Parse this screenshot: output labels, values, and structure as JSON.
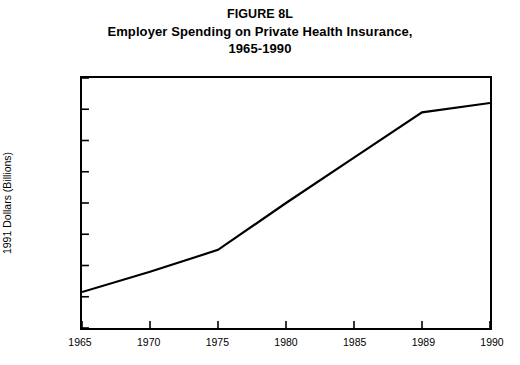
{
  "title": {
    "figure_number": "FIGURE 8L",
    "main": "Employer Spending on Private Health Insurance,",
    "period": "1965-1990"
  },
  "chart_data": {
    "type": "line",
    "title": "FIGURE 8L Employer Spending on Private Health Insurance, 1965-1990",
    "xlabel": "",
    "ylabel": "1991 Dollars (Billions)",
    "categories": [
      "1965",
      "1970",
      "1975",
      "1980",
      "1985",
      "1989",
      "1990"
    ],
    "values": [
      23,
      36,
      50,
      80,
      109,
      138,
      144
    ],
    "series": [
      {
        "name": "Employer Spending on Private Health Insurance",
        "values": [
          23,
          36,
          50,
          80,
          109,
          138,
          144
        ]
      }
    ],
    "vertices": [
      {
        "x": "1965",
        "y": 23
      },
      {
        "x": "1975",
        "y": 50
      },
      {
        "x": "1989",
        "y": 138
      },
      {
        "x": "1990",
        "y": 144
      }
    ],
    "ylim": [
      0,
      160
    ],
    "ytick_step": 20,
    "yticks": [
      0,
      20,
      40,
      60,
      80,
      100,
      120,
      140,
      160
    ],
    "ytick_labels": [
      "0",
      "20",
      "40",
      "60",
      "80",
      "100",
      "120",
      "140",
      "160"
    ],
    "xticks": [
      "1965",
      "1970",
      "1975",
      "1980",
      "1985",
      "1989",
      "1990"
    ],
    "grid": false,
    "legend": false,
    "legend_position": "none",
    "line_color": "#000000",
    "background_color": "#ffffff",
    "axis_color": "#000000",
    "tick_direction": "in",
    "note": "Horizontal axis uses equal category spacing; 1989 and 1990 are adjacent categories."
  }
}
